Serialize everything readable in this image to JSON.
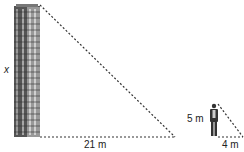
{
  "diagram": {
    "building_height_label": "x",
    "building_shadow_label": "21 m",
    "person_height_label": "5 m",
    "person_shadow_label": "4 m"
  }
}
